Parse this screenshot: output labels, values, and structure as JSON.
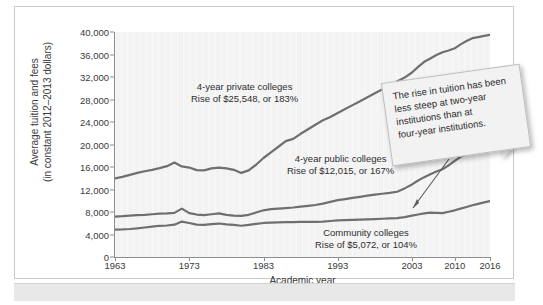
{
  "chart_data": {
    "type": "line",
    "title": "",
    "xlabel": "Academic year",
    "ylabel": "Average tuition and fees (in constant 2012–2013 dollars)",
    "ylabel_line1": "Average tuition and fees",
    "ylabel_line2": "(in constant 2012–2013 dollars)",
    "ylim": [
      0,
      40000
    ],
    "yticks": [
      0,
      4000,
      8000,
      12000,
      16000,
      20000,
      24000,
      28000,
      32000,
      36000,
      40000
    ],
    "ytick_labels": [
      "0",
      "4,000",
      "8,000",
      "12,000",
      "16,000",
      "20,000",
      "24,000",
      "28,000",
      "32,000",
      "36,000",
      "40,000"
    ],
    "xlim": [
      1963,
      2016
    ],
    "xticks": [
      1963,
      1973,
      1983,
      1993,
      2003,
      2010,
      2016
    ],
    "xtick_labels": [
      "1963",
      "1973",
      "1983",
      "1993",
      "2003",
      "2010",
      "2016"
    ],
    "grid": "faint vertical gridlines only",
    "legend_position": "inline annotations on plot",
    "line_color": "#6f6f6f",
    "plot_background": "#f3f3f3",
    "x": [
      1963,
      1964,
      1965,
      1966,
      1967,
      1968,
      1969,
      1970,
      1971,
      1972,
      1973,
      1974,
      1975,
      1976,
      1977,
      1978,
      1979,
      1980,
      1981,
      1982,
      1983,
      1984,
      1985,
      1986,
      1987,
      1988,
      1989,
      1990,
      1991,
      1992,
      1993,
      1994,
      1995,
      1996,
      1997,
      1998,
      1999,
      2000,
      2001,
      2002,
      2003,
      2004,
      2005,
      2006,
      2007,
      2008,
      2009,
      2010,
      2011,
      2012,
      2013,
      2014,
      2015,
      2016
    ],
    "series": [
      {
        "name": "4-year private colleges",
        "label_line1": "4-year private colleges",
        "label_line2": "Rise of $25,548, or 183%",
        "rise_dollars": "$25,548",
        "rise_percent": "183%",
        "values": [
          13960,
          14250,
          14600,
          14950,
          15250,
          15500,
          15800,
          16150,
          16800,
          16100,
          15900,
          15450,
          15400,
          15750,
          15900,
          15750,
          15500,
          14950,
          15400,
          16400,
          17600,
          18600,
          19600,
          20600,
          21000,
          21900,
          22700,
          23500,
          24300,
          24900,
          25600,
          26300,
          27000,
          27700,
          28400,
          29100,
          29800,
          30500,
          31200,
          31900,
          32800,
          33800,
          34700,
          35300,
          35900,
          36400,
          36700,
          37100,
          37800,
          38400,
          38900,
          39100,
          39300,
          39508
        ]
      },
      {
        "name": "4-year public colleges",
        "label_line1": "4-year public colleges",
        "label_line2": "Rise of $12,015, or 167%",
        "rise_dollars": "$12,015",
        "rise_percent": "167%",
        "values": [
          7185,
          7250,
          7350,
          7450,
          7500,
          7600,
          7700,
          7750,
          7850,
          8600,
          7800,
          7550,
          7450,
          7600,
          7750,
          7500,
          7350,
          7300,
          7500,
          7900,
          8300,
          8500,
          8600,
          8700,
          8800,
          8950,
          9100,
          9250,
          9500,
          9800,
          10100,
          10300,
          10500,
          10700,
          10900,
          11100,
          11250,
          11400,
          11600,
          12200,
          12900,
          13600,
          14200,
          14700,
          15200,
          15600,
          16300,
          17100,
          17800,
          18300,
          18600,
          18850,
          19050,
          19200
        ]
      },
      {
        "name": "Community colleges",
        "label_line1": "Community colleges",
        "label_line2": "Rise of $5,072, or 104%",
        "rise_dollars": "$5,072",
        "rise_percent": "104%",
        "values": [
          4877,
          4900,
          4980,
          5100,
          5250,
          5400,
          5550,
          5600,
          5750,
          6300,
          6050,
          5750,
          5700,
          5850,
          5950,
          5800,
          5700,
          5550,
          5700,
          5900,
          6050,
          6100,
          6150,
          6200,
          6200,
          6250,
          6250,
          6250,
          6300,
          6400,
          6500,
          6550,
          6600,
          6650,
          6700,
          6750,
          6800,
          6850,
          6900,
          7100,
          7350,
          7550,
          7750,
          7900,
          7850,
          7800,
          8050,
          8300,
          8600,
          8900,
          9200,
          9450,
          9700,
          9949
        ]
      }
    ],
    "callout": {
      "text": "The rise in tuition has been less steep at two-year institutions than at four-year institutions.",
      "line1": "The rise in tuition has been",
      "line2": "less steep at two-year",
      "line3": "institutions than at",
      "line4": "four-year institutions."
    }
  }
}
